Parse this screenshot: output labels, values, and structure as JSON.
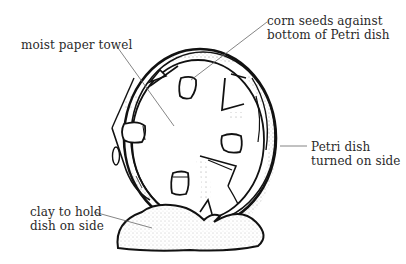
{
  "diagram": {
    "labels": {
      "corn_seeds": {
        "line1": "corn seeds against",
        "line2": "bottom of Petri dish"
      },
      "paper_towel": {
        "line1": "moist paper towel"
      },
      "petri_dish": {
        "line1": "Petri dish",
        "line2": "turned on side"
      },
      "clay": {
        "line1": "clay to hold",
        "line2": "dish on side"
      }
    },
    "colors": {
      "ink": "#111111",
      "leader_line": "#555555",
      "background": "#ffffff"
    }
  }
}
